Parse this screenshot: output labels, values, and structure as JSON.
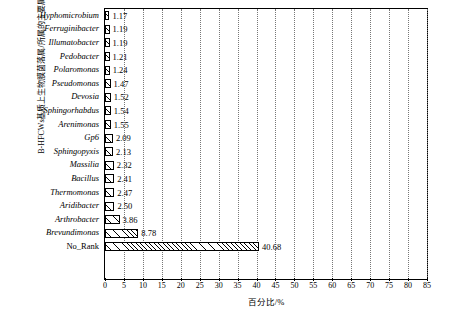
{
  "chart_data": {
    "type": "bar",
    "orientation": "horizontal",
    "title": "",
    "xlabel": "百分比/%",
    "ylabel": "B-HFCWs基质上生物膜菌落属/所属的主要属",
    "categories": [
      "Hyphomicrobium",
      "Ferruginibacter",
      "Illumatobacter",
      "Pedobacter",
      "Polaromonas",
      "Pseudomonas",
      "Devosia",
      "Sphingorhabdus",
      "Arenimonas",
      "Gp6",
      "Sphingopyxis",
      "Massilia",
      "Bacillus",
      "Thermomonas",
      "Aridibacter",
      "Arthrobacter",
      "Brevundimonas",
      "No_Rank"
    ],
    "values": [
      1.17,
      1.19,
      1.19,
      1.21,
      1.24,
      1.47,
      1.52,
      1.54,
      1.55,
      2.09,
      2.13,
      2.32,
      2.41,
      2.47,
      2.5,
      3.86,
      8.78,
      40.68
    ],
    "value_labels": [
      "1.17",
      "1.19",
      "1.19",
      "1.21",
      "1.24",
      "1.47",
      "1.52",
      "1.54",
      "1.55",
      "2.09",
      "2.13",
      "2.32",
      "2.41",
      "2.47",
      "2.50",
      "3.86",
      "8.78",
      "40.68"
    ],
    "xticks": [
      0,
      5,
      10,
      15,
      20,
      25,
      30,
      35,
      40,
      45,
      50,
      55,
      60,
      65,
      70,
      75,
      80,
      85
    ],
    "xlim": [
      0,
      85
    ],
    "grid": "vertical-dotted",
    "legend": "none",
    "bar_style": "hatched-diagonal",
    "bar_border_color": "#000000",
    "bar_fill_color": "#ffffff"
  }
}
